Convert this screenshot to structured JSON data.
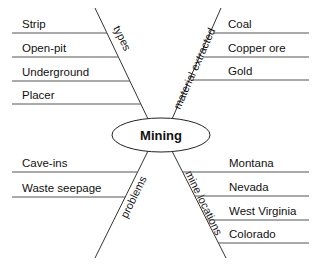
{
  "diagram": {
    "type": "spider-map",
    "center": {
      "label": "Mining"
    },
    "branches": [
      {
        "category": "types",
        "position": "top-left",
        "items": [
          "Strip",
          "Open-pit",
          "Underground",
          "Placer"
        ]
      },
      {
        "category": "material extracted",
        "position": "top-right",
        "items": [
          "Coal",
          "Copper ore",
          "Gold"
        ]
      },
      {
        "category": "problems",
        "position": "bottom-left",
        "items": [
          "Cave-ins",
          "Waste seepage"
        ]
      },
      {
        "category": "mine locations",
        "position": "bottom-right",
        "items": [
          "Montana",
          "Nevada",
          "West Virginia",
          "Colorado"
        ]
      }
    ]
  },
  "colors": {
    "lines": "#555555",
    "text": "#111111",
    "background": "#ffffff"
  }
}
